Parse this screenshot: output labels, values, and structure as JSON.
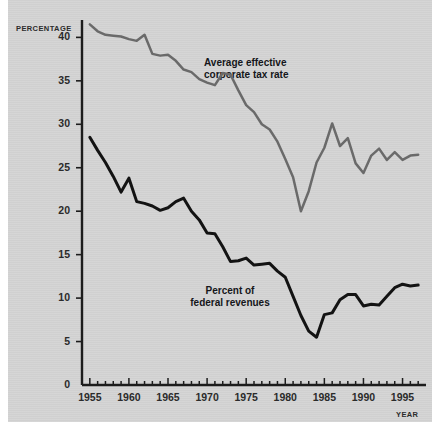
{
  "chart_data": {
    "type": "line",
    "title": "",
    "xlabel": "YEAR",
    "ylabel": "PERCENTAGE",
    "xlim": [
      1954,
      1998
    ],
    "ylim": [
      0,
      42
    ],
    "grid": false,
    "legend_position": "inline-annotations",
    "y_ticks": [
      0,
      5,
      10,
      15,
      20,
      25,
      30,
      35,
      40
    ],
    "x_ticks": [
      1955,
      1960,
      1965,
      1970,
      1975,
      1980,
      1985,
      1990,
      1995
    ],
    "x_minor_tick_interval": 1,
    "x": [
      1955,
      1956,
      1957,
      1958,
      1959,
      1960,
      1961,
      1962,
      1963,
      1964,
      1965,
      1966,
      1967,
      1968,
      1969,
      1970,
      1971,
      1972,
      1973,
      1974,
      1975,
      1976,
      1977,
      1978,
      1979,
      1980,
      1981,
      1982,
      1983,
      1984,
      1985,
      1986,
      1987,
      1988,
      1989,
      1990,
      1991,
      1992,
      1993,
      1994,
      1995,
      1996,
      1997
    ],
    "series": [
      {
        "name": "Average effective corporate tax rate",
        "color": "#6a6a6a",
        "values": [
          41.5,
          40.7,
          40.3,
          40.2,
          40.1,
          39.8,
          39.6,
          40.3,
          38.1,
          37.9,
          38.0,
          37.3,
          36.3,
          36.0,
          35.2,
          34.8,
          34.5,
          35.9,
          35.7,
          33.9,
          32.2,
          31.4,
          30.0,
          29.4,
          28.0,
          26.0,
          23.9,
          20.0,
          22.3,
          25.6,
          27.3,
          30.1,
          27.5,
          28.4,
          25.5,
          24.4,
          26.4,
          27.2,
          25.9,
          26.8,
          25.9,
          26.4,
          26.5
        ]
      },
      {
        "name": "Percent of federal revenues",
        "color": "#131313",
        "values": [
          28.5,
          27.0,
          25.6,
          24.0,
          22.2,
          23.8,
          21.1,
          20.9,
          20.6,
          20.1,
          20.4,
          21.1,
          21.5,
          20.0,
          19.0,
          17.5,
          17.4,
          15.9,
          14.2,
          14.3,
          14.6,
          13.8,
          13.9,
          14.0,
          13.1,
          12.4,
          10.2,
          8.0,
          6.2,
          5.5,
          8.1,
          8.3,
          9.8,
          10.4,
          10.4,
          9.1,
          9.3,
          9.2,
          10.2,
          11.2,
          11.6,
          11.4,
          11.5
        ]
      }
    ]
  },
  "axes": {
    "y_title": "PERCENTAGE",
    "x_title": "YEAR",
    "y_tick_labels": [
      "40",
      "35",
      "30",
      "25",
      "20",
      "15",
      "10",
      "5",
      "0"
    ],
    "x_tick_labels": [
      "1955",
      "1960",
      "1965",
      "1970",
      "1975",
      "1980",
      "1985",
      "1990",
      "1995"
    ]
  },
  "annotations": {
    "corporate": {
      "line1": "Average effective",
      "line2": "corporate tax rate"
    },
    "federal": {
      "line1": "Percent of",
      "line2": "federal revenues"
    }
  },
  "colors": {
    "background": "#d4d4d4",
    "page": "#ffffff",
    "axis": "#1c1c1c",
    "series_corporate": "#6a6a6a",
    "series_federal": "#131313",
    "text": "#2b2b2b"
  }
}
